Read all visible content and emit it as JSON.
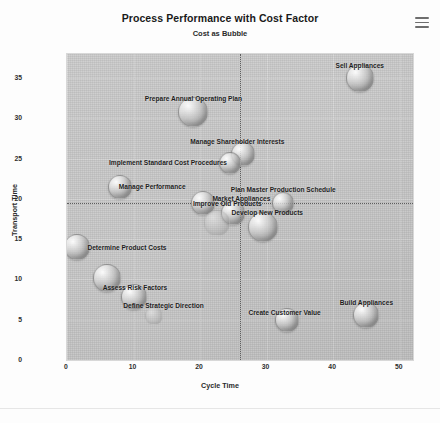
{
  "header": {
    "title": "Process Performance with Cost Factor",
    "subtitle": "Cost as Bubble",
    "menu_icon": "hamburger-menu-icon"
  },
  "chart_data": {
    "type": "scatter",
    "title": "Process Performance with Cost Factor",
    "subtitle": "Cost as Bubble",
    "xlabel": "Cycle Time",
    "ylabel": "Transport Time",
    "xlim": [
      0,
      52
    ],
    "ylim": [
      0,
      38
    ],
    "xticks": [
      "0",
      "10",
      "20",
      "30",
      "40",
      "50"
    ],
    "xtick_values": [
      0,
      10,
      20,
      30,
      40,
      50
    ],
    "yticks": [
      "0",
      "5",
      "10",
      "15",
      "20",
      "25",
      "30",
      "35"
    ],
    "ytick_values": [
      0,
      5,
      10,
      15,
      20,
      25,
      30,
      35
    ],
    "grid": true,
    "legend": "none",
    "bubble_encodes": "Cost",
    "reference_lines": [
      {
        "axis": "x",
        "value": 26,
        "style": "dotted"
      },
      {
        "axis": "y",
        "value": 19.5,
        "style": "dotted"
      }
    ],
    "points": [
      {
        "label": "Sell Appliances",
        "x": 44.0,
        "y": 35.0,
        "size": 13,
        "label_dx": 0,
        "label_dy": -13
      },
      {
        "label": "Prepare Annual Operating Plan",
        "x": 19.0,
        "y": 30.8,
        "size": 14,
        "label_dx": 0,
        "label_dy": -14
      },
      {
        "label": "Manage Shareholder Interests",
        "x": 26.5,
        "y": 25.6,
        "size": 11,
        "label_dx": -6,
        "label_dy": -13
      },
      {
        "label": "Implement Standard Cost Procedures",
        "x": 24.5,
        "y": 24.5,
        "size": 10,
        "label_dx": -62,
        "label_dy": -1
      },
      {
        "label": "Manage Performance",
        "x": 8.0,
        "y": 21.5,
        "size": 11,
        "label_dx": 32,
        "label_dy": -1
      },
      {
        "label": "Market Appliances",
        "x": 20.5,
        "y": 19.5,
        "size": 11,
        "label_dx": 38,
        "label_dy": -5
      },
      {
        "label": "Plan Master Production Schedule",
        "x": 32.5,
        "y": 19.5,
        "size": 10,
        "label_dx": 0,
        "label_dy": -14
      },
      {
        "label": "Improve Old Products",
        "x": 25.0,
        "y": 18.3,
        "size": 11,
        "label_dx": -6,
        "label_dy": -10
      },
      {
        "label": "Develop New Products",
        "x": 29.5,
        "y": 16.5,
        "size": 14,
        "label_dx": 4,
        "label_dy": -15
      },
      {
        "label": "Determine Product Costs",
        "x": 1.5,
        "y": 14.0,
        "size": 12,
        "label_dx": 50,
        "label_dy": 0
      },
      {
        "label": "Assess Risk Factors",
        "x": 6.0,
        "y": 10.2,
        "size": 13,
        "label_dx": 28,
        "label_dy": 9
      },
      {
        "label": "Define Strategic Direction",
        "x": 10.0,
        "y": 7.8,
        "size": 12,
        "label_dx": 30,
        "label_dy": 8
      },
      {
        "label": "Create Customer Value",
        "x": 33.0,
        "y": 5.0,
        "size": 11,
        "label_dx": -2,
        "label_dy": -8
      },
      {
        "label": "Build Appliances",
        "x": 45.0,
        "y": 5.6,
        "size": 12,
        "label_dx": 0,
        "label_dy": -13
      },
      {
        "label": "",
        "x": 22.5,
        "y": 17.0,
        "size": 12,
        "label_dx": 0,
        "label_dy": 0
      },
      {
        "label": "",
        "x": 13.0,
        "y": 5.5,
        "size": 8,
        "label_dx": 0,
        "label_dy": 0
      }
    ]
  }
}
